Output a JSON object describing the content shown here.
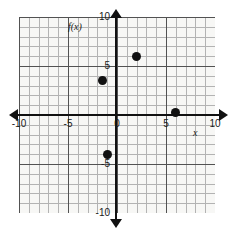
{
  "chart_data": {
    "type": "scatter",
    "title": "",
    "xlabel": "x",
    "ylabel": "f(x)",
    "xlim": [
      -10,
      10
    ],
    "ylim": [
      -10,
      10
    ],
    "grid": true,
    "grid_minor_step": 1,
    "grid_major_step": 5,
    "legend": "none",
    "xticks": [
      -10,
      -5,
      0,
      5,
      10
    ],
    "yticks": [
      -10,
      -5,
      0,
      5,
      10
    ],
    "xtick_labels": [
      "-10",
      "-5",
      "0",
      "5",
      "10"
    ],
    "ytick_labels": [
      "-10",
      "-5",
      "0",
      "5",
      "10"
    ],
    "points": [
      {
        "label": "point-1",
        "x": -1.5,
        "y": 3.5
      },
      {
        "label": "point-2",
        "x": 2,
        "y": 6
      },
      {
        "label": "point-3",
        "x": 6,
        "y": 0.3
      },
      {
        "label": "point-4",
        "x": -1,
        "y": -4
      }
    ],
    "marker": "filled-circle",
    "marker_color": "#111111"
  },
  "axes": {
    "y_axis_name": "f(x)",
    "x_axis_name": "x",
    "x_tick_labels": [
      {
        "value": -10,
        "text": "-10"
      },
      {
        "value": -5,
        "text": "-5"
      },
      {
        "value": 0,
        "text": "0"
      },
      {
        "value": 5,
        "text": "5"
      },
      {
        "value": 10,
        "text": "10"
      }
    ],
    "y_tick_labels": [
      {
        "value": 10,
        "text": "10"
      },
      {
        "value": 5,
        "text": "5"
      },
      {
        "value": -5,
        "text": "-5"
      },
      {
        "value": -10,
        "text": "-10"
      }
    ]
  },
  "colors": {
    "background": "#ffffff",
    "plot_background": "#f7f7f5",
    "grid_minor": "#9a9a9a",
    "grid_major": "#4a4a4a",
    "axis": "#111111",
    "point": "#111111",
    "text": "#1a1a1a"
  }
}
